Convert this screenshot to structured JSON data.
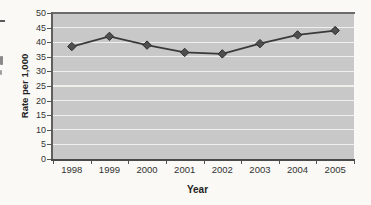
{
  "page": {
    "background": "#faf9f5"
  },
  "chart_data": {
    "type": "line",
    "categories": [
      "1998",
      "1999",
      "2000",
      "2001",
      "2002",
      "2003",
      "2004",
      "2005"
    ],
    "values": [
      38.5,
      42,
      39,
      36.5,
      36,
      39.5,
      42.5,
      44
    ],
    "series_name": "Rate per 1,000",
    "title": "",
    "xlabel": "Year",
    "ylabel": "Rate per 1,000",
    "ylim": [
      0,
      50
    ],
    "yticks": [
      0,
      5,
      10,
      15,
      20,
      25,
      30,
      35,
      40,
      45,
      50
    ],
    "grid": "horizontal",
    "gridline_color": "#efefec",
    "legend": "none",
    "plot_bg": "#c8c8c8",
    "line_color": "#3a3a3a",
    "marker": "diamond",
    "marker_color": "#4f4f4f",
    "marker_outline": "#2e2e2e"
  }
}
